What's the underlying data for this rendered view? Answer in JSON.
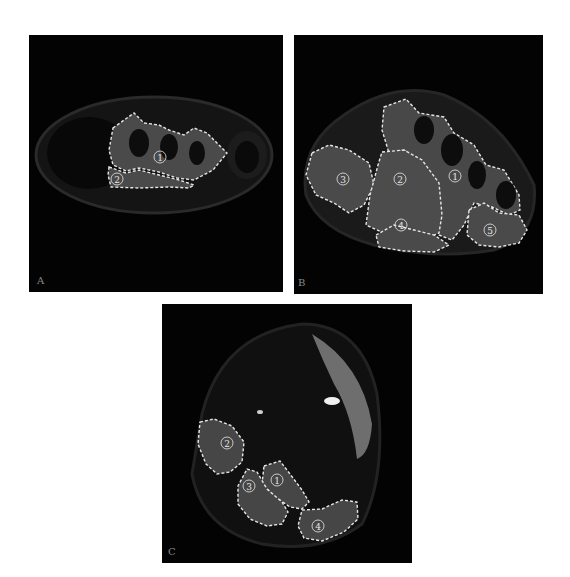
{
  "figure": {
    "panels": [
      {
        "id": "A",
        "letter": "A",
        "regions": [
          {
            "number": "1",
            "symbol": "①"
          },
          {
            "number": "2",
            "symbol": "②"
          }
        ]
      },
      {
        "id": "B",
        "letter": "B",
        "regions": [
          {
            "number": "1",
            "symbol": "①"
          },
          {
            "number": "2",
            "symbol": "②"
          },
          {
            "number": "3",
            "symbol": "③"
          },
          {
            "number": "4",
            "symbol": "④"
          },
          {
            "number": "5",
            "symbol": "⑤"
          }
        ]
      },
      {
        "id": "C",
        "letter": "C",
        "regions": [
          {
            "number": "1",
            "symbol": "①"
          },
          {
            "number": "2",
            "symbol": "②"
          },
          {
            "number": "3",
            "symbol": "③"
          },
          {
            "number": "4",
            "symbol": "④"
          }
        ]
      }
    ],
    "colors": {
      "background": "#ffffff",
      "panel_bg": "#030303",
      "outline": "#e6e6e6",
      "tissue": "#3a3a3a",
      "muscle": "#505050"
    }
  }
}
